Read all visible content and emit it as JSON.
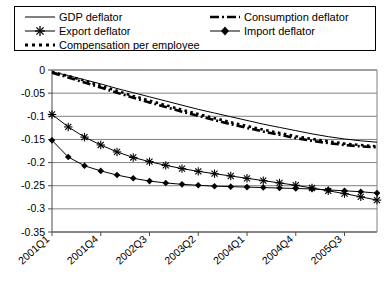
{
  "legend": {
    "items": [
      {
        "label": "GDP deflator",
        "key": "solid-thin-line",
        "name": "legend-gdp-deflator"
      },
      {
        "label": "Consumption deflator",
        "key": "dash-dot-thick-line",
        "name": "legend-consumption-deflator"
      },
      {
        "label": "Export deflator",
        "key": "line-with-star-marker",
        "name": "legend-export-deflator"
      },
      {
        "label": "Import deflator",
        "key": "line-with-diamond-marker",
        "name": "legend-import-deflator"
      },
      {
        "label": "Compensation per employee",
        "key": "dotted-thick-line",
        "name": "legend-compensation-per-employee"
      }
    ]
  },
  "chart_data": {
    "type": "line",
    "title": "",
    "xlabel": "",
    "ylabel": "",
    "grid": true,
    "legend_position": "top",
    "ylim": [
      -0.35,
      0
    ],
    "yticks": [
      0,
      -0.05,
      -0.1,
      -0.15,
      -0.2,
      -0.25,
      -0.3,
      -0.35
    ],
    "ytick_labels": [
      "0",
      "-0.05",
      "-0.1",
      "-0.15",
      "-0.2",
      "-0.25",
      "-0.3",
      "-0.35"
    ],
    "x": [
      "2001Q1",
      "2001Q2",
      "2001Q3",
      "2001Q4",
      "2002Q1",
      "2002Q2",
      "2002Q3",
      "2002Q4",
      "2003Q1",
      "2003Q2",
      "2003Q3",
      "2003Q4",
      "2004Q1",
      "2004Q2",
      "2004Q3",
      "2004Q4",
      "2005Q1",
      "2005Q2",
      "2005Q3",
      "2005Q4",
      "2006Q1"
    ],
    "xtick_labels": [
      "2001Q1",
      "2001Q4",
      "2002Q3",
      "2003Q2",
      "2004Q1",
      "2004Q4",
      "2005Q3"
    ],
    "xtick_indices": [
      0,
      3,
      6,
      9,
      12,
      15,
      18
    ],
    "series": [
      {
        "name": "GDP deflator",
        "style": "solid-thin",
        "marker": "none",
        "values": [
          -0.004,
          -0.012,
          -0.021,
          -0.03,
          -0.04,
          -0.049,
          -0.058,
          -0.067,
          -0.076,
          -0.085,
          -0.093,
          -0.101,
          -0.109,
          -0.117,
          -0.124,
          -0.131,
          -0.138,
          -0.144,
          -0.149,
          -0.153,
          -0.156
        ]
      },
      {
        "name": "Consumption deflator",
        "style": "dash-dot-thick",
        "marker": "none",
        "values": [
          -0.006,
          -0.016,
          -0.027,
          -0.038,
          -0.049,
          -0.06,
          -0.07,
          -0.08,
          -0.09,
          -0.099,
          -0.108,
          -0.117,
          -0.125,
          -0.133,
          -0.14,
          -0.147,
          -0.153,
          -0.158,
          -0.162,
          -0.165,
          -0.167
        ]
      },
      {
        "name": "Compensation per employee",
        "style": "dotted-thick",
        "marker": "none",
        "values": [
          -0.004,
          -0.013,
          -0.023,
          -0.034,
          -0.045,
          -0.056,
          -0.066,
          -0.076,
          -0.086,
          -0.095,
          -0.104,
          -0.113,
          -0.121,
          -0.129,
          -0.136,
          -0.143,
          -0.149,
          -0.154,
          -0.159,
          -0.162,
          -0.165
        ]
      },
      {
        "name": "Export deflator",
        "style": "solid-thin",
        "marker": "star",
        "values": [
          -0.096,
          -0.123,
          -0.145,
          -0.162,
          -0.177,
          -0.189,
          -0.198,
          -0.206,
          -0.213,
          -0.219,
          -0.224,
          -0.229,
          -0.234,
          -0.239,
          -0.244,
          -0.249,
          -0.255,
          -0.261,
          -0.267,
          -0.274,
          -0.281
        ]
      },
      {
        "name": "Import deflator",
        "style": "solid-thin",
        "marker": "diamond",
        "values": [
          -0.152,
          -0.188,
          -0.207,
          -0.218,
          -0.227,
          -0.234,
          -0.24,
          -0.244,
          -0.247,
          -0.249,
          -0.251,
          -0.252,
          -0.253,
          -0.254,
          -0.255,
          -0.256,
          -0.257,
          -0.259,
          -0.261,
          -0.263,
          -0.266
        ]
      }
    ]
  }
}
